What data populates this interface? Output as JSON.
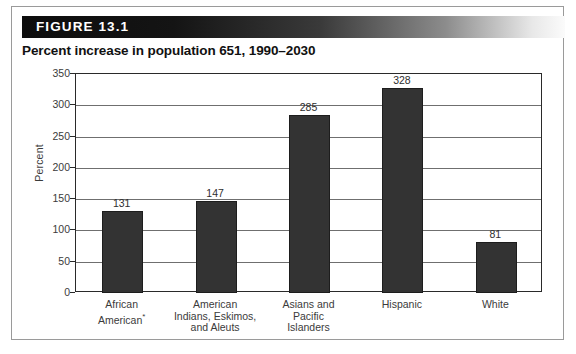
{
  "figure": {
    "banner_label": "FIGURE 13.1",
    "title": "Percent increase in population 651, 1990–2030"
  },
  "colors": {
    "bar_fill": "#333333",
    "bar_stroke": "#1d1d1d",
    "axis": "#2a2a2a",
    "gridline": "#6f6f6f",
    "banner_start": "#0d0d0d",
    "banner_end": "#fbfbfb",
    "banner_text": "#ffffff",
    "title_text": "#111111",
    "label_text": "#3b3b3b"
  },
  "chart_data": {
    "type": "bar",
    "title": "Percent increase in population 651, 1990–2030",
    "xlabel": "",
    "ylabel": "Percent",
    "ylim": [
      0,
      350
    ],
    "ytick_step": 50,
    "yticks": [
      0,
      50,
      100,
      150,
      200,
      250,
      300,
      350
    ],
    "ytick_labels": [
      "0",
      "50",
      "100",
      "150",
      "200",
      "250",
      "300",
      "350"
    ],
    "grid": true,
    "legend": false,
    "categories": [
      "African American*",
      "American Indians, Eskimos, and Aleuts",
      "Asians and Pacific Islanders",
      "Hispanic",
      "White"
    ],
    "category_lines": [
      [
        "African",
        "American*"
      ],
      [
        "American",
        "Indians, Eskimos,",
        "and Aleuts"
      ],
      [
        "Asians and",
        "Pacific",
        "Islanders"
      ],
      [
        "Hispanic"
      ],
      [
        "White"
      ]
    ],
    "values": [
      131,
      147,
      285,
      328,
      81
    ],
    "value_labels": [
      "131",
      "147",
      "285",
      "328",
      "81"
    ]
  }
}
